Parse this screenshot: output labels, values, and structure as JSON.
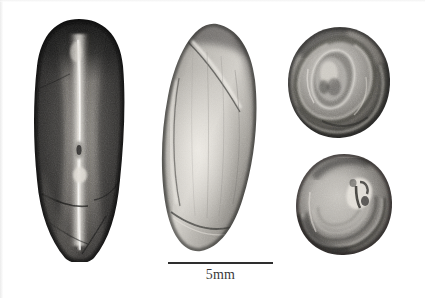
{
  "figure": {
    "kind": "specimen-photo-plate",
    "background_color": "#ffffff",
    "rendering": "grayscale",
    "width": 425,
    "height": 298
  },
  "scale_bar": {
    "label": "5mm",
    "length_px": 105,
    "line_color": "#2e2e2e",
    "x": 168,
    "y": 262
  },
  "specimens": [
    {
      "id": "specimen-1",
      "name": "seed-ventral-view",
      "view": "ventral",
      "description": "dark elongated seed with pale central raphe groove",
      "tone": "dark",
      "x": 32,
      "y": 18,
      "width": 95,
      "height": 244,
      "base_color": "#5a5a5a",
      "shadow_color": "#1a1a1a",
      "highlight_color": "#d8d6d2"
    },
    {
      "id": "specimen-2",
      "name": "seed-lateral-view",
      "view": "lateral",
      "description": "pale smooth elongated seed, oblique ridge near apex",
      "tone": "light",
      "x": 155,
      "y": 22,
      "width": 108,
      "height": 231,
      "base_color": "#a9a6a0",
      "shadow_color": "#4b4a47",
      "highlight_color": "#e6e4df"
    },
    {
      "id": "specimen-3",
      "name": "seed-apical-view",
      "view": "apical",
      "description": "rounded seed end showing coiled concentric ridges",
      "tone": "mid",
      "x": 286,
      "y": 25,
      "width": 107,
      "height": 115,
      "base_color": "#8d8a85",
      "shadow_color": "#2b2a28",
      "highlight_color": "#ddd9d3"
    },
    {
      "id": "specimen-4",
      "name": "seed-basal-view",
      "view": "basal",
      "description": "rounded seed base with concentric growth lines and pale hilum",
      "tone": "mid",
      "x": 294,
      "y": 152,
      "width": 100,
      "height": 105,
      "base_color": "#94918c",
      "shadow_color": "#333230",
      "highlight_color": "#e2ded8"
    }
  ]
}
